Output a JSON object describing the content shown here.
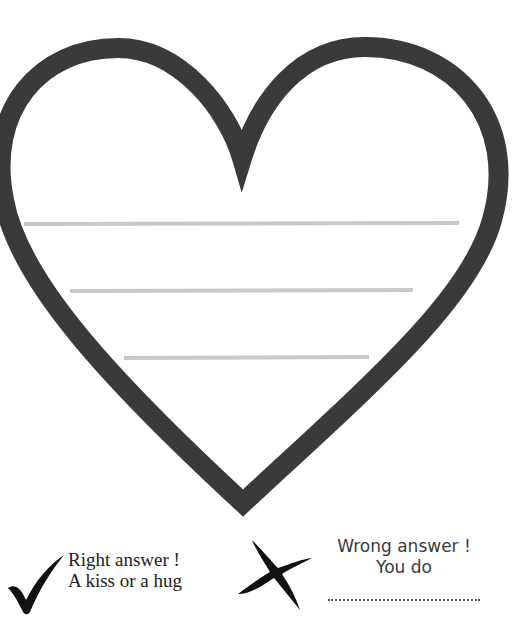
{
  "worksheet": {
    "heart": {
      "outline_color": "#3a3a3a",
      "write_line_color": "#c8c8c8",
      "write_lines": 3
    },
    "legend": {
      "right": {
        "icon": "check-mark-icon",
        "line1": "Right answer !",
        "line2": "A kiss or a hug"
      },
      "wrong": {
        "icon": "cross-mark-icon",
        "line1": "Wrong answer !",
        "line2": "You do",
        "blank": "………………………………"
      }
    }
  }
}
